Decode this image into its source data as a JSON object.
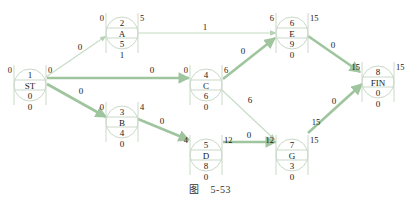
{
  "figure": {
    "caption_prefix": "图",
    "caption_number": "5-53"
  },
  "colors": {
    "node_stroke": "#c9d9c9",
    "thin_edge": "#c6dcc6",
    "critical_edge": "#9ec59e",
    "text": "#1a1a1a"
  },
  "nodes": [
    {
      "id": "1",
      "name": "ST",
      "cx": 30,
      "cy": 85,
      "duration": "0",
      "slack": "0",
      "es": "0",
      "ef": "0"
    },
    {
      "id": "2",
      "name": "A",
      "cx": 122,
      "cy": 33,
      "duration": "5",
      "slack": "1",
      "es": "0",
      "ef": "5"
    },
    {
      "id": "3",
      "name": "B",
      "cx": 122,
      "cy": 122,
      "duration": "4",
      "slack": "0",
      "es": "0",
      "ef": "4"
    },
    {
      "id": "4",
      "name": "C",
      "cx": 206,
      "cy": 85,
      "duration": "6",
      "slack": "0",
      "es": "0",
      "ef": "6"
    },
    {
      "id": "5",
      "name": "D",
      "cx": 206,
      "cy": 155,
      "duration": "8",
      "slack": "0",
      "es": "4",
      "ef": "12"
    },
    {
      "id": "6",
      "name": "E",
      "cx": 292,
      "cy": 33,
      "duration": "9",
      "slack": "0",
      "es": "6",
      "ef": "15"
    },
    {
      "id": "7",
      "name": "G",
      "cx": 292,
      "cy": 155,
      "duration": "3",
      "slack": "0",
      "es": "12",
      "ef": "15"
    },
    {
      "id": "8",
      "name": "FIN",
      "cx": 378,
      "cy": 82,
      "duration": "0",
      "slack": "0",
      "es": "15",
      "ef": "15"
    }
  ],
  "edges": [
    {
      "from": "1",
      "to": "2",
      "label": "0",
      "critical": false,
      "x1": 46,
      "y1": 77,
      "x2": 106,
      "y2": 36,
      "lx": 80,
      "ly": 50
    },
    {
      "from": "1",
      "to": "4",
      "label": "0",
      "critical": true,
      "x1": 47,
      "y1": 78,
      "x2": 189,
      "y2": 78,
      "lx": 152,
      "ly": 73
    },
    {
      "from": "1",
      "to": "3",
      "label": "0",
      "critical": true,
      "x1": 47,
      "y1": 84,
      "x2": 106,
      "y2": 117,
      "lx": 81,
      "ly": 94
    },
    {
      "from": "2",
      "to": "6",
      "label": "1",
      "critical": false,
      "x1": 138,
      "y1": 33,
      "x2": 276,
      "y2": 33,
      "lx": 205,
      "ly": 30
    },
    {
      "from": "3",
      "to": "5",
      "label": "0",
      "critical": true,
      "x1": 138,
      "y1": 119,
      "x2": 189,
      "y2": 140,
      "lx": 162,
      "ly": 124
    },
    {
      "from": "4",
      "to": "6",
      "label": "0",
      "critical": true,
      "x1": 223,
      "y1": 79,
      "x2": 275,
      "y2": 38,
      "lx": 243,
      "ly": 54
    },
    {
      "from": "4",
      "to": "7",
      "label": "6",
      "critical": false,
      "x1": 222,
      "y1": 90,
      "x2": 275,
      "y2": 140,
      "lx": 250,
      "ly": 103
    },
    {
      "from": "5",
      "to": "7",
      "label": "0",
      "critical": true,
      "x1": 223,
      "y1": 142,
      "x2": 276,
      "y2": 142,
      "lx": 249,
      "ly": 138
    },
    {
      "from": "6",
      "to": "8",
      "label": "0",
      "critical": true,
      "x1": 308,
      "y1": 36,
      "x2": 360,
      "y2": 72,
      "lx": 333,
      "ly": 48
    },
    {
      "from": "7",
      "to": "8",
      "label": "0",
      "critical": true,
      "x1": 308,
      "y1": 133,
      "x2": 362,
      "y2": 84,
      "lx": 334,
      "ly": 104
    }
  ],
  "edge_aux_labels": [
    {
      "edge": "7-8",
      "text": "15",
      "x": 316,
      "y": 125
    }
  ]
}
